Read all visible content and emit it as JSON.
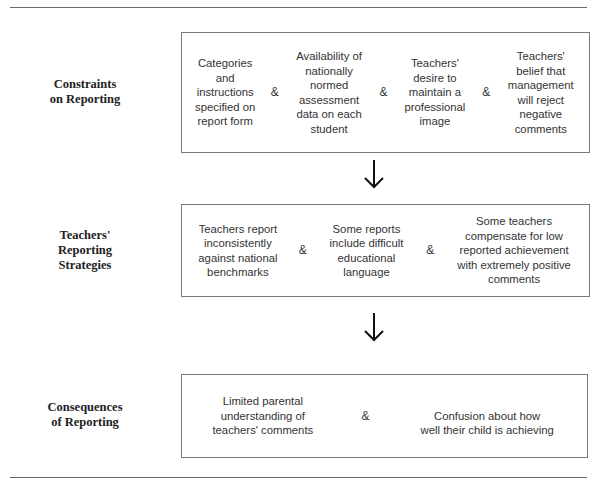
{
  "rows": [
    {
      "label": [
        "Constraints",
        "on Reporting"
      ],
      "items": [
        [
          "Categories",
          "and",
          "instructions",
          "specified on",
          "report form"
        ],
        [
          "Availability of",
          "nationally",
          "normed",
          "assessment",
          "data on each",
          "student"
        ],
        [
          "Teachers'",
          "desire to",
          "maintain a",
          "professional",
          "image"
        ],
        [
          "Teachers'",
          "belief that",
          "management",
          "will reject",
          "negative",
          "comments"
        ]
      ]
    },
    {
      "label": [
        "Teachers'",
        "Reporting",
        "Strategies"
      ],
      "items": [
        [
          "Teachers report",
          "inconsistently",
          "against national",
          "benchmarks"
        ],
        [
          "Some reports",
          "include difficult",
          "educational",
          "language"
        ],
        [
          "Some teachers",
          "compensate for low",
          "reported achievement",
          "with extremely positive",
          "comments"
        ]
      ]
    },
    {
      "label": [
        "Consequences",
        "of Reporting"
      ],
      "items": [
        [
          "Limited parental",
          "understanding of",
          "teachers' comments"
        ],
        [
          "Confusion about how",
          "well their child is achieving"
        ]
      ]
    }
  ],
  "connector": "&",
  "arrows": [
    "down-arrow",
    "down-arrow"
  ]
}
